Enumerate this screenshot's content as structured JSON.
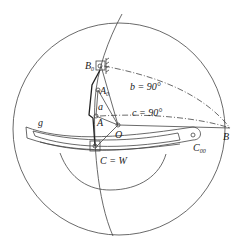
{
  "diagram": {
    "labels": {
      "B0": "B",
      "B0_sub": "0",
      "A0": "A",
      "A0_sub": "0",
      "a": "a",
      "A": "A",
      "O": "O",
      "g": "g",
      "B": "B",
      "C00": "C",
      "C00_sub": "00",
      "CW": "C = W",
      "b_angle": "b = 90°",
      "c_angle": "c = 90°"
    },
    "colors": {
      "stroke": "#444444",
      "background": "#ffffff"
    }
  }
}
